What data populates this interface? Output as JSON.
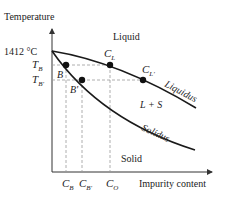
{
  "diagram": {
    "axes": {
      "y_label": "Temperature",
      "x_label": "Impurity content",
      "melting_point_label": "1412 °C"
    },
    "regions": {
      "liquid": "Liquid",
      "two_phase": "L + S",
      "solid": "Solid"
    },
    "curves": {
      "liquidus": "Liquidus",
      "solidus": "Solidus"
    },
    "y_ticks": {
      "tb": "T",
      "tb_sub": "B",
      "tbp": "T",
      "tbp_sub": "B'"
    },
    "points": {
      "b": "B",
      "bp": "B'",
      "cl": "C",
      "cl_sub": "L",
      "clp": "C",
      "clp_sub": "L'"
    },
    "x_ticks": {
      "cb": "C",
      "cb_sub": "B",
      "cbp": "C",
      "cbp_sub": "B'",
      "co": "C",
      "co_sub": "O"
    },
    "colors": {
      "curve": "#1a1a1a",
      "dashed": "#9a9a9a",
      "text": "#222222"
    }
  }
}
